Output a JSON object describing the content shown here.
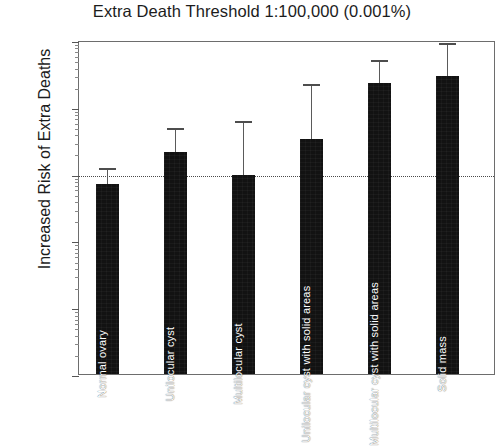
{
  "chart_data": {
    "type": "bar",
    "title": "Extra Death Threshold 1:100,000 (0.001%)",
    "xlabel": "",
    "ylabel": "Increased Risk of Extra Deaths",
    "yscale": "log",
    "ylim": [
      0.1,
      10000
    ],
    "ytick_labels": [
      "10000",
      "1000",
      "100",
      "10",
      "1",
      "0.1"
    ],
    "ytick_values": [
      10000,
      1000,
      100,
      10,
      1,
      0.1
    ],
    "grid": false,
    "legend": "none",
    "threshold_line": {
      "value": 100,
      "style": "dotted",
      "label": ""
    },
    "categories": [
      "Normal ovary",
      "Unilocular cyst",
      "Multilocular cyst",
      "Unilocular cyst with solid areas",
      "Multilocular cyst with solid areas",
      "Solid mass"
    ],
    "values": [
      70,
      210,
      95,
      330,
      2300,
      2900
    ],
    "error_high": [
      120,
      480,
      620,
      2200,
      5000,
      9000
    ],
    "bar_color": "#121212",
    "error_color": "#4d4d4d"
  }
}
